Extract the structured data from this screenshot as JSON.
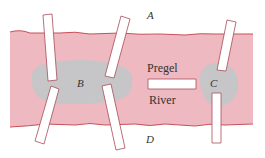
{
  "colors": {
    "river": "#eeb9c0",
    "river_edge": "#c9505a",
    "island": "#c6c6c8",
    "bridge_fill": "#ffffff",
    "bridge_stroke": "#a84b55",
    "label": "#333333"
  },
  "labels": {
    "land_north": "A",
    "island_west": "B",
    "island_east": "C",
    "land_south": "D",
    "river_name_1": "Pregel",
    "river_name_2": "River"
  },
  "bridges": [
    {
      "id": "b1",
      "connects": [
        "A",
        "B"
      ]
    },
    {
      "id": "b2",
      "connects": [
        "A",
        "B"
      ]
    },
    {
      "id": "b3",
      "connects": [
        "B",
        "D"
      ]
    },
    {
      "id": "b4",
      "connects": [
        "B",
        "D"
      ]
    },
    {
      "id": "b5",
      "connects": [
        "B",
        "C"
      ]
    },
    {
      "id": "b6",
      "connects": [
        "A",
        "C"
      ]
    },
    {
      "id": "b7",
      "connects": [
        "C",
        "D"
      ]
    }
  ]
}
